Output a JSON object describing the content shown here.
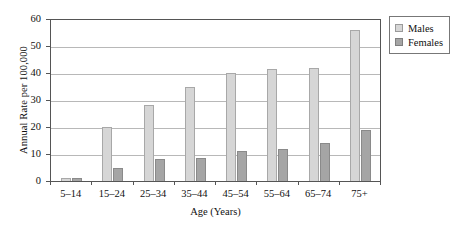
{
  "chart_data": {
    "type": "bar",
    "title": "",
    "xlabel": "Age (Years)",
    "ylabel": "Annual Rate per 100,000",
    "categories": [
      "5–14",
      "15–24",
      "25–34",
      "35–44",
      "45–54",
      "55–64",
      "65–74",
      "75+"
    ],
    "series": [
      {
        "name": "Males",
        "color": "#d6d6d6",
        "values": [
          1,
          20,
          28,
          35,
          40,
          41.5,
          42,
          56
        ]
      },
      {
        "name": "Females",
        "color": "#a5a5a5",
        "values": [
          1,
          5,
          8,
          8.5,
          11,
          12,
          14,
          19
        ]
      }
    ],
    "ylim": [
      0,
      60
    ],
    "yticks": [
      0,
      10,
      20,
      30,
      40,
      50,
      60
    ],
    "ytick_labels": [
      "0",
      "10",
      "20",
      "30",
      "40",
      "50",
      "60"
    ],
    "grid": true,
    "legend_position": "top-right",
    "legend": [
      {
        "label": "Males",
        "swatch": "males-swatch"
      },
      {
        "label": "Females",
        "swatch": "females-swatch"
      }
    ]
  }
}
